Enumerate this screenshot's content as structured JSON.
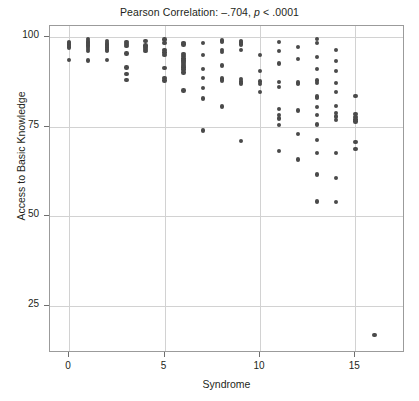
{
  "chart_data": {
    "type": "scatter",
    "title": "Pearson Correlation: –.704, p < .0001",
    "title_prefix": "Pearson Correlation: –.704, ",
    "title_italic": "p",
    "title_suffix": " < .0001",
    "xlabel": "Syndrome",
    "ylabel": "Access to Basic Knowledge",
    "xlim": [
      -1,
      17.6
    ],
    "ylim": [
      12,
      103
    ],
    "xticks": [
      0,
      5,
      10,
      15
    ],
    "yticks": [
      25,
      50,
      75,
      100
    ],
    "xtick_labels": [
      "0",
      "5",
      "10",
      "15"
    ],
    "ytick_labels": [
      "25",
      "50",
      "75",
      "100"
    ],
    "grid": true,
    "grid_color": "#d2d2d2",
    "point_color": "#4a4a4a",
    "frame_color": "#9b9b9b",
    "legend": null,
    "correlation_r": -0.704,
    "p_value": "< .0001",
    "points": [
      [
        0,
        98.6
      ],
      [
        0,
        98.2
      ],
      [
        0,
        97.8
      ],
      [
        0,
        97.4
      ],
      [
        0,
        97.0
      ],
      [
        0,
        93.6
      ],
      [
        1,
        99.4
      ],
      [
        1,
        98.9
      ],
      [
        1,
        98.4
      ],
      [
        1,
        98.0
      ],
      [
        1,
        97.6
      ],
      [
        1,
        97.1
      ],
      [
        1,
        96.6
      ],
      [
        1,
        96.1
      ],
      [
        1,
        93.4
      ],
      [
        2,
        98.8
      ],
      [
        2,
        98.3
      ],
      [
        2,
        97.9
      ],
      [
        2,
        97.4
      ],
      [
        2,
        97.0
      ],
      [
        2,
        96.5
      ],
      [
        2,
        96.0
      ],
      [
        2,
        93.5
      ],
      [
        3,
        98.6
      ],
      [
        3,
        98.0
      ],
      [
        3,
        97.4
      ],
      [
        3,
        95.4
      ],
      [
        3,
        91.5
      ],
      [
        3,
        89.6
      ],
      [
        3,
        88.0
      ],
      [
        4,
        98.8
      ],
      [
        4,
        97.6
      ],
      [
        4,
        97.1
      ],
      [
        4,
        96.6
      ],
      [
        4,
        96.1
      ],
      [
        5,
        99.2
      ],
      [
        5,
        98.3
      ],
      [
        5,
        96.3
      ],
      [
        5,
        95.6
      ],
      [
        5,
        94.9
      ],
      [
        5,
        91.3
      ],
      [
        5,
        88.6
      ],
      [
        5,
        87.8
      ],
      [
        6,
        98.3
      ],
      [
        6,
        97.8
      ],
      [
        6,
        95.2
      ],
      [
        6,
        94.6
      ],
      [
        6,
        94.0
      ],
      [
        6,
        93.4
      ],
      [
        6,
        92.9
      ],
      [
        6,
        92.4
      ],
      [
        6,
        91.9
      ],
      [
        6,
        91.4
      ],
      [
        6,
        90.9
      ],
      [
        6,
        90.1
      ],
      [
        6,
        85.0
      ],
      [
        7,
        98.2
      ],
      [
        7,
        95.0
      ],
      [
        7,
        91.0
      ],
      [
        7,
        88.5
      ],
      [
        7,
        85.8
      ],
      [
        7,
        82.8
      ],
      [
        7,
        73.9
      ],
      [
        8,
        99.0
      ],
      [
        8,
        98.5
      ],
      [
        8,
        96.4
      ],
      [
        8,
        95.8
      ],
      [
        8,
        92.0
      ],
      [
        8,
        88.4
      ],
      [
        8,
        87.8
      ],
      [
        8,
        80.6
      ],
      [
        9,
        98.9
      ],
      [
        9,
        98.4
      ],
      [
        9,
        97.9
      ],
      [
        9,
        96.3
      ],
      [
        9,
        88.3
      ],
      [
        9,
        87.6
      ],
      [
        9,
        87.0
      ],
      [
        9,
        71.0
      ],
      [
        10,
        94.9
      ],
      [
        10,
        90.5
      ],
      [
        10,
        87.6
      ],
      [
        10,
        86.9
      ],
      [
        10,
        84.7
      ],
      [
        11,
        98.5
      ],
      [
        11,
        96.1
      ],
      [
        11,
        92.6
      ],
      [
        11,
        87.4
      ],
      [
        11,
        86.0
      ],
      [
        11,
        79.9
      ],
      [
        11,
        78.3
      ],
      [
        11,
        77.3
      ],
      [
        11,
        75.4
      ],
      [
        11,
        68.2
      ],
      [
        12,
        97.2
      ],
      [
        12,
        93.8
      ],
      [
        12,
        87.3
      ],
      [
        12,
        86.8
      ],
      [
        12,
        79.5
      ],
      [
        12,
        72.9
      ],
      [
        12,
        65.9
      ],
      [
        13,
        99.3
      ],
      [
        13,
        98.2
      ],
      [
        13,
        94.4
      ],
      [
        13,
        91.0
      ],
      [
        13,
        87.8
      ],
      [
        13,
        87.2
      ],
      [
        13,
        83.4
      ],
      [
        13,
        82.9
      ],
      [
        13,
        80.4
      ],
      [
        13,
        78.2
      ],
      [
        13,
        75.6
      ],
      [
        13,
        71.2
      ],
      [
        13,
        67.6
      ],
      [
        13,
        61.7
      ],
      [
        13,
        54.2
      ],
      [
        14,
        96.4
      ],
      [
        14,
        93.3
      ],
      [
        14,
        90.4
      ],
      [
        14,
        87.2
      ],
      [
        14,
        84.6
      ],
      [
        14,
        80.7
      ],
      [
        14,
        78.8
      ],
      [
        14,
        77.8
      ],
      [
        14,
        76.9
      ],
      [
        14,
        67.7
      ],
      [
        14,
        60.7
      ],
      [
        14,
        54.1
      ],
      [
        15,
        83.5
      ],
      [
        15,
        78.5
      ],
      [
        15,
        77.6
      ],
      [
        15,
        77.0
      ],
      [
        15,
        76.4
      ],
      [
        15,
        70.8
      ],
      [
        15,
        68.8
      ],
      [
        16,
        17.0
      ]
    ]
  }
}
